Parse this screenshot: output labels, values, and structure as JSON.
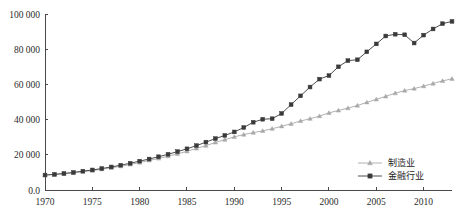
{
  "chart_data": {
    "type": "line",
    "title": "",
    "subtitle": "",
    "xlabel": "",
    "ylabel": "",
    "xlim": [
      1970,
      2013
    ],
    "ylim": [
      0,
      100000
    ],
    "grid": false,
    "legend_position": "bottom-right",
    "ytick_labels": [
      "100 000",
      "80 000",
      "60 000",
      "40 000",
      "20 000",
      "0.0"
    ],
    "ytick_values": [
      100000,
      80000,
      60000,
      40000,
      20000,
      0
    ],
    "xtick_labels": [
      "1970",
      "1975",
      "1980",
      "1985",
      "1990",
      "1995",
      "2000",
      "2005",
      "2010"
    ],
    "xtick_values": [
      1970,
      1975,
      1980,
      1985,
      1990,
      1995,
      2000,
      2005,
      2010
    ],
    "x": [
      1970,
      1971,
      1972,
      1973,
      1974,
      1975,
      1976,
      1977,
      1978,
      1979,
      1980,
      1981,
      1982,
      1983,
      1984,
      1985,
      1986,
      1987,
      1988,
      1989,
      1990,
      1991,
      1992,
      1993,
      1994,
      1995,
      1996,
      1997,
      1998,
      1999,
      2000,
      2001,
      2002,
      2003,
      2004,
      2005,
      2006,
      2007,
      2008,
      2009,
      2010,
      2011,
      2012,
      2013
    ],
    "series": [
      {
        "name": "制造业",
        "marker": "triangle",
        "color": "#a8a8a8",
        "values": [
          8500,
          8800,
          9200,
          9800,
          10400,
          11000,
          11800,
          12600,
          13500,
          14500,
          15600,
          16800,
          17900,
          19200,
          20500,
          22000,
          23600,
          25200,
          27000,
          28600,
          30200,
          31500,
          32600,
          33600,
          34800,
          36200,
          37600,
          39200,
          40500,
          42000,
          43800,
          45200,
          46500,
          48000,
          49800,
          51500,
          53200,
          55000,
          56500,
          57600,
          59000,
          60500,
          62000,
          63200
        ]
      },
      {
        "name": "金融行业",
        "marker": "square",
        "color": "#3a3a3a",
        "values": [
          8500,
          8900,
          9400,
          10000,
          10700,
          11400,
          12200,
          13100,
          14100,
          15200,
          16400,
          17600,
          18900,
          20300,
          21800,
          23400,
          25200,
          27200,
          29200,
          31000,
          33000,
          35500,
          38500,
          40200,
          40500,
          43500,
          48500,
          53500,
          58500,
          63000,
          65000,
          70000,
          73500,
          74000,
          78500,
          83000,
          87500,
          88500,
          88200,
          83500,
          88000,
          91500,
          94500,
          95800
        ]
      }
    ]
  },
  "legend": {
    "items": [
      {
        "label": "制造业",
        "marker": "triangle",
        "color": "#a8a8a8"
      },
      {
        "label": "金融行业",
        "marker": "square",
        "color": "#3a3a3a"
      }
    ]
  }
}
